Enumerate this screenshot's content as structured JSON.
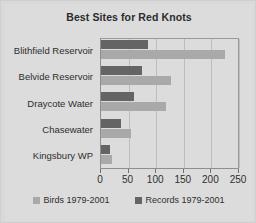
{
  "chart_data": {
    "type": "bar",
    "orientation": "horizontal",
    "title": "Best Sites for Red Knots",
    "xlabel": "",
    "ylabel": "",
    "categories": [
      "Blithfield Reservoir",
      "Belvide Reservoir",
      "Draycote Water",
      "Chasewater",
      "Kingsbury WP"
    ],
    "series": [
      {
        "name": "Birds 1979-2001",
        "color": "#a9a9a9",
        "values": [
          225,
          126,
          118,
          55,
          20
        ]
      },
      {
        "name": "Records 1979-2001",
        "color": "#646464",
        "values": [
          85,
          74,
          59,
          36,
          17
        ]
      }
    ],
    "xlim": [
      0,
      250
    ],
    "xticks": [
      0,
      50,
      100,
      150,
      200,
      250
    ],
    "xtick_labels": [
      "0",
      "50",
      "100",
      "150",
      "200",
      "250"
    ],
    "grid": true,
    "grid_axis": "x",
    "legend_position": "bottom",
    "background_color": "#dcdcdc",
    "plot_border_color": "#8e8e8e",
    "gridline_color": "#bdbdbd",
    "title_color": "#2b2b2b"
  }
}
